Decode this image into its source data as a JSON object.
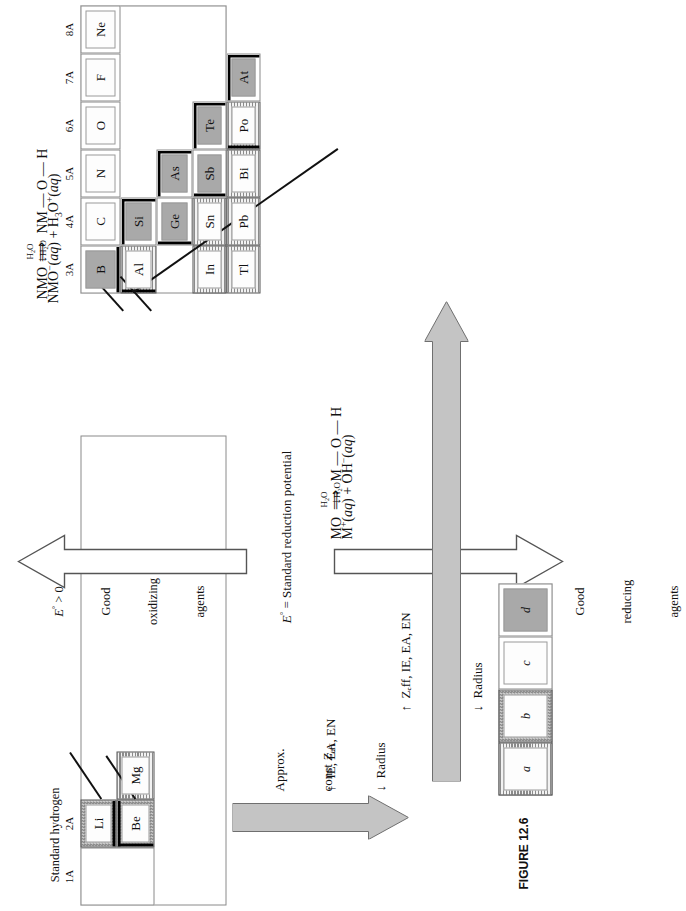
{
  "figure": {
    "caption": "FIGURE 12.6"
  },
  "she": {
    "line1": "Standard hydrogen",
    "line2": "electrode  (SHE)",
    "line3_html": "2H<sup>+</sup>(aq) + 2e<sup>−</sup> → H<sub>2</sub>(g)",
    "line4_html": "E° = 0.000 V"
  },
  "potential_scale": {
    "middle_label": "E° = Standard reduction potential",
    "top": {
      "line1": "E° > 0",
      "line2": "Good",
      "line3": "oxidizing",
      "line4": "agents"
    },
    "bottom": {
      "line1": "E° < 0",
      "line2": "Good",
      "line3": "reducing",
      "line4": "agents"
    }
  },
  "trend_arrows": {
    "vertical_up": {
      "line1": "↑  Zₑff, IE, EA, EN",
      "line2": "↓  Radius"
    },
    "horizontal_left": {
      "line1": "Approx.",
      "line2": "const Zₑff",
      "line3": "↑ ↓   IE, EA, EN",
      "line4": "Radius"
    }
  },
  "reactions": {
    "nonmetal_oxide": {
      "step1_left": "NMO",
      "step1_arrow_label": "H₂O",
      "step1_right": "NM — O — H",
      "step2_arrow_label": "H₂O",
      "step3": "NMO⁻(aq) + H₃O⁺(aq)"
    },
    "metal_oxide": {
      "step1_left": "MO",
      "step1_arrow_label": "H₂O",
      "step1_right": "M — O — H",
      "step2_arrow_label": "H₂O",
      "step3": "M⁺(aq) + OH⁻(aq)"
    }
  },
  "periodic_table": {
    "group_labels": [
      "1A",
      "2A",
      "3A",
      "4A",
      "5A",
      "6A",
      "7A",
      "8A"
    ],
    "left_block": {
      "group_labels": [
        "1A",
        "2A"
      ],
      "cells": [
        {
          "symbol": "Li",
          "skin": "b"
        },
        {
          "symbol": "Be",
          "skin": "b"
        },
        {
          "symbol": "Mg",
          "skin": "a"
        }
      ]
    },
    "right_block": {
      "rows": [
        [
          {
            "symbol": "B",
            "skin": "d"
          },
          {
            "symbol": "C",
            "skin": "c"
          },
          {
            "symbol": "N",
            "skin": "c"
          },
          {
            "symbol": "O",
            "skin": "c"
          },
          {
            "symbol": "F",
            "skin": "c"
          },
          {
            "symbol": "Ne",
            "skin": "c"
          }
        ],
        [
          {
            "symbol": "Al",
            "skin": "a"
          },
          {
            "symbol": "Si",
            "skin": "d"
          }
        ],
        [
          {
            "symbol": "Ga",
            "skin": "a"
          },
          {
            "symbol": "Ge",
            "skin": "d"
          },
          {
            "symbol": "As",
            "skin": "d"
          }
        ],
        [
          {
            "symbol": "In",
            "skin": "a"
          },
          {
            "symbol": "Sn",
            "skin": "a"
          },
          {
            "symbol": "Sb",
            "skin": "d"
          },
          {
            "symbol": "Te",
            "skin": "d"
          }
        ],
        [
          {
            "symbol": "Tl",
            "skin": "a"
          },
          {
            "symbol": "Pb",
            "skin": "a"
          },
          {
            "symbol": "Bi",
            "skin": "a"
          },
          {
            "symbol": "Po",
            "skin": "a"
          },
          {
            "symbol": "At",
            "skin": "d"
          }
        ]
      ],
      "visible_symbols": [
        "B",
        "C",
        "N",
        "O",
        "F",
        "Ne",
        "Al",
        "Si",
        "Ge",
        "As",
        "In",
        "Sn",
        "Sb",
        "Te",
        "Tl",
        "Pb",
        "Bi",
        "Po",
        "At"
      ]
    }
  },
  "legend": {
    "items": [
      {
        "label": "a",
        "skin": "a"
      },
      {
        "label": "b",
        "skin": "b"
      },
      {
        "label": "c",
        "skin": "c"
      },
      {
        "label": "d",
        "skin": "d"
      }
    ]
  }
}
